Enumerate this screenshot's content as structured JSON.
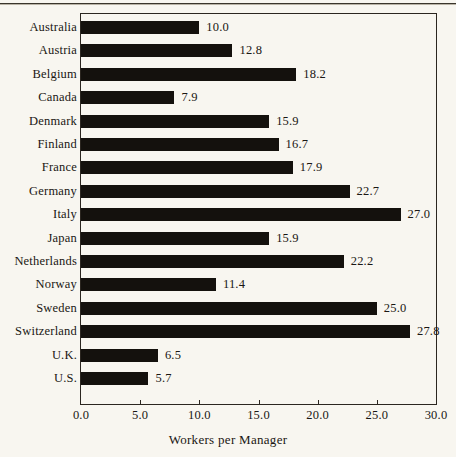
{
  "chart_data": {
    "type": "bar",
    "orientation": "horizontal",
    "title": "",
    "xlabel": "Workers per Manager",
    "ylabel": "",
    "xlim": [
      0.0,
      30.0
    ],
    "xticks": [
      "0.0",
      "5.0",
      "10.0",
      "15.0",
      "20.0",
      "25.0",
      "30.0"
    ],
    "xtick_values": [
      0.0,
      5.0,
      10.0,
      15.0,
      20.0,
      25.0,
      30.0
    ],
    "grid": false,
    "legend": false,
    "data_labels": true,
    "bar_color": "#14110d",
    "background_color": "#f8f6f0",
    "categories": [
      "Australia",
      "Austria",
      "Belgium",
      "Canada",
      "Denmark",
      "Finland",
      "France",
      "Germany",
      "Italy",
      "Japan",
      "Netherlands",
      "Norway",
      "Sweden",
      "Switzerland",
      "U.K.",
      "U.S."
    ],
    "values": [
      10.0,
      12.8,
      18.2,
      7.9,
      15.9,
      16.7,
      17.9,
      22.7,
      27.0,
      15.9,
      22.2,
      11.4,
      25.0,
      27.8,
      6.5,
      5.7
    ],
    "value_labels": [
      "10.0",
      "12.8",
      "18.2",
      "7.9",
      "15.9",
      "16.7",
      "17.9",
      "22.7",
      "27.0",
      "15.9",
      "22.2",
      "11.4",
      "25.0",
      "27.8",
      "6.5",
      "5.7"
    ]
  }
}
